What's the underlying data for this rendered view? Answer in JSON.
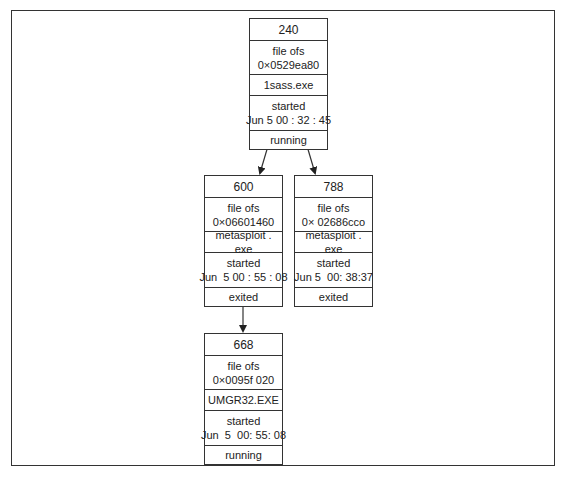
{
  "diagram": {
    "type": "process-tree",
    "nodes": [
      {
        "id": "n240",
        "pid": "240",
        "ofs_label": "file ofs",
        "ofs_value": "0×0529ea80",
        "name": "1sass.exe",
        "started_label": "started",
        "started_time": "Jun 5 00 : 32 : 45",
        "status": "running"
      },
      {
        "id": "n600",
        "pid": "600",
        "ofs_label": "file ofs",
        "ofs_value": "0×06601460",
        "name": "metasploit . exe",
        "started_label": "started",
        "started_time": "Jun  5 00 : 55 : 08",
        "status": "exited"
      },
      {
        "id": "n788",
        "pid": "788",
        "ofs_label": "file ofs",
        "ofs_value": "0× 02686cco",
        "name": "metasploit . exe",
        "started_label": "started",
        "started_time": "Jun 5  00: 38:37",
        "status": "exited"
      },
      {
        "id": "n668",
        "pid": "668",
        "ofs_label": "file ofs",
        "ofs_value": "0×0095f 020",
        "name": "UMGR32.EXE",
        "started_label": "started",
        "started_time": "Jun  5  00: 55: 08",
        "status": "running"
      }
    ],
    "edges": [
      {
        "from": "240",
        "to": "600"
      },
      {
        "from": "240",
        "to": "788"
      },
      {
        "from": "600",
        "to": "668"
      }
    ],
    "colors": {
      "line": "#333333",
      "background": "#ffffff",
      "text": "#222222"
    }
  }
}
